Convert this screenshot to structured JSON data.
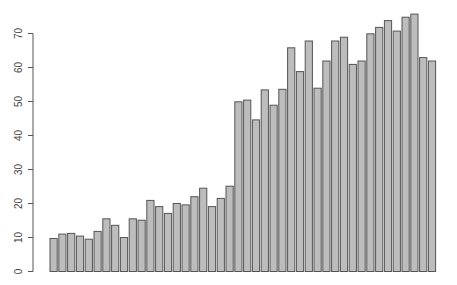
{
  "chart_data": {
    "type": "bar",
    "title": "",
    "xlabel": "",
    "ylabel": "",
    "ylim": [
      0,
      76
    ],
    "grid": false,
    "legend": null,
    "y_ticks": [
      0,
      10,
      20,
      30,
      40,
      50,
      60,
      70
    ],
    "categories": [
      "1",
      "2",
      "3",
      "4",
      "5",
      "6",
      "7",
      "8",
      "9",
      "10",
      "11",
      "12",
      "13",
      "14",
      "15",
      "16",
      "17",
      "18",
      "19",
      "20",
      "21",
      "22",
      "23",
      "24",
      "25",
      "26",
      "27",
      "28",
      "29",
      "30",
      "31",
      "32",
      "33",
      "34",
      "35",
      "36",
      "37",
      "38",
      "39",
      "40",
      "41",
      "42",
      "43",
      "44"
    ],
    "values": [
      9.7,
      11.0,
      11.2,
      10.4,
      9.5,
      11.8,
      15.5,
      13.6,
      10.0,
      15.5,
      15.1,
      20.9,
      19.1,
      17.1,
      20.0,
      19.6,
      22.0,
      24.5,
      19.1,
      21.5,
      25.1,
      49.9,
      50.4,
      44.6,
      53.4,
      48.9,
      53.6,
      65.8,
      58.8,
      67.8,
      53.9,
      61.9,
      67.8,
      68.9,
      60.9,
      61.9,
      69.9,
      71.8,
      73.8,
      70.7,
      74.8,
      75.7,
      62.9,
      61.9
    ],
    "colors": {
      "bar_fill": "#bdbdbd",
      "bar_border": "#555555",
      "axis": "#555555"
    }
  }
}
